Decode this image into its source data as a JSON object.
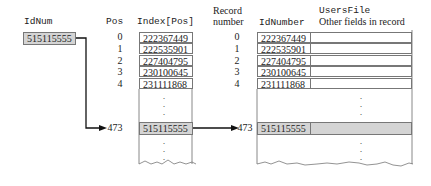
{
  "search_key": {
    "label": "IdNum",
    "value": "515115555"
  },
  "index_array": {
    "pos_header": "Pos",
    "header": "Index[Pos]",
    "rows": [
      {
        "pos": "0",
        "value": "222367449"
      },
      {
        "pos": "1",
        "value": "222535901"
      },
      {
        "pos": "2",
        "value": "227404795"
      },
      {
        "pos": "3",
        "value": "230100645"
      },
      {
        "pos": "4",
        "value": "231111868"
      }
    ],
    "found": {
      "pos": "473",
      "value": "515115555"
    }
  },
  "users_file": {
    "title": "UsersFile",
    "record_number_header_line1": "Record",
    "record_number_header_line2": "number",
    "id_header": "IdNumber",
    "other_header": "Other fields in record",
    "rows": [
      {
        "record": "0",
        "id": "222367449"
      },
      {
        "record": "1",
        "id": "222535901"
      },
      {
        "record": "2",
        "id": "227404795"
      },
      {
        "record": "3",
        "id": "230100645"
      },
      {
        "record": "4",
        "id": "231111868"
      }
    ],
    "found": {
      "record": "473",
      "id": "515115555"
    }
  },
  "colors": {
    "highlight": "#d4d4d4",
    "border": "#777777",
    "arrow": "#111111"
  }
}
